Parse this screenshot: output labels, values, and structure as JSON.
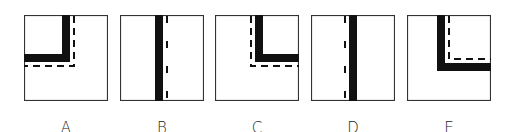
{
  "figure": {
    "panels": [
      {
        "id": "A",
        "label": "A",
        "solid": "L-shape top-left quadrant (vertical bar right, horizontal bar bottom)",
        "dashed": "outside, right and below"
      },
      {
        "id": "B",
        "label": "B",
        "solid": "vertical bar center",
        "dashed": "right of bar"
      },
      {
        "id": "C",
        "label": "C",
        "solid": "L-shape top-right quadrant (vertical bar left, horizontal bar bottom)",
        "dashed": "outside, left and below"
      },
      {
        "id": "D",
        "label": "D",
        "solid": "vertical bar center",
        "dashed": "left of bar"
      },
      {
        "id": "E",
        "label": "E",
        "solid": "L-shape top-right quadrant (vertical bar left, horizontal bar bottom)",
        "dashed": "inside, right and above"
      }
    ],
    "colors": {
      "line": "#111111",
      "border": "#333333",
      "background": "#ffffff"
    }
  }
}
